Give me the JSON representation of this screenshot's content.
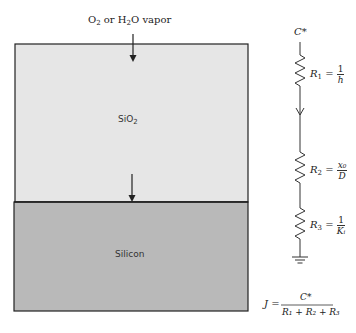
{
  "diagram": {
    "top_label": {
      "pre": "O",
      "sub1": "2",
      "mid": " or H",
      "sub2": "2",
      "post": "O vapor"
    },
    "oxide_layer": {
      "label": "SiO",
      "sub": "2",
      "fill": "#e6e6e6"
    },
    "silicon_layer": {
      "label": "Silicon",
      "fill": "#b9b9b9"
    },
    "circuit": {
      "source": "C*",
      "r1": {
        "name": "R",
        "sub": "1",
        "num": "1",
        "den": "h"
      },
      "r2": {
        "name": "R",
        "sub": "2",
        "num": "x₀",
        "den": "D"
      },
      "r3": {
        "name": "R",
        "sub": "3",
        "num": "1",
        "den": "Kᵢ"
      },
      "ground": "ground"
    },
    "flux_equation": {
      "lhs": "J",
      "numerator": "C*",
      "denominator": "R₁ + R₂ + R₃"
    }
  }
}
